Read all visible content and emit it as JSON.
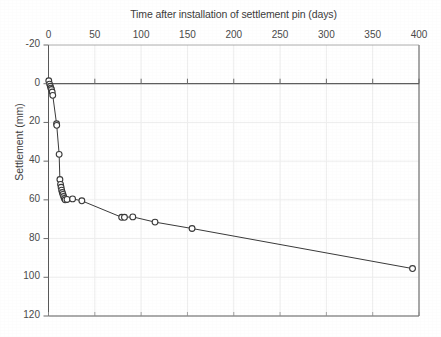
{
  "chart_data": {
    "type": "scatter",
    "title": "Time after installation of settlement pin (days)",
    "subtitle": "",
    "xlabel": "Time after installation of settlement pin (days)",
    "ylabel": "Settlement (mm)",
    "xlim": [
      0,
      400
    ],
    "ylim": [
      -20,
      120
    ],
    "y_inverted": true,
    "xticks": [
      0,
      50,
      100,
      150,
      200,
      250,
      300,
      350,
      400
    ],
    "yticks": [
      -20,
      0,
      20,
      40,
      60,
      80,
      100,
      120
    ],
    "grid": true,
    "legend": "none",
    "marker": "open-circle",
    "line_color": "#3a3a3a",
    "marker_color": "#3a3a3a",
    "grid_color": "#ededed",
    "axis_color": "#595959",
    "series": [
      {
        "name": "Settlement pin",
        "points": [
          [
            0.3,
            -1.5
          ],
          [
            1.2,
            0.2
          ],
          [
            2.0,
            1.3
          ],
          [
            2.6,
            2.3
          ],
          [
            3.2,
            3.0
          ],
          [
            4.0,
            4.3
          ],
          [
            4.6,
            6.0
          ],
          [
            8.7,
            20.7
          ],
          [
            8.9,
            21.5
          ],
          [
            11.5,
            36.5
          ],
          [
            12.3,
            49.5
          ],
          [
            13.0,
            52.0
          ],
          [
            13.6,
            53.5
          ],
          [
            14.2,
            55.0
          ],
          [
            14.9,
            56.2
          ],
          [
            15.6,
            57.2
          ],
          [
            16.3,
            58.3
          ],
          [
            17.2,
            59.3
          ],
          [
            18.0,
            60.0
          ],
          [
            20.0,
            59.8
          ],
          [
            26.0,
            59.5
          ],
          [
            36.0,
            60.5
          ],
          [
            79.0,
            69.0
          ],
          [
            82.0,
            69.0
          ],
          [
            91.0,
            68.8
          ],
          [
            115.0,
            71.5
          ],
          [
            155.0,
            74.8
          ],
          [
            393.0,
            95.5
          ]
        ]
      }
    ]
  }
}
